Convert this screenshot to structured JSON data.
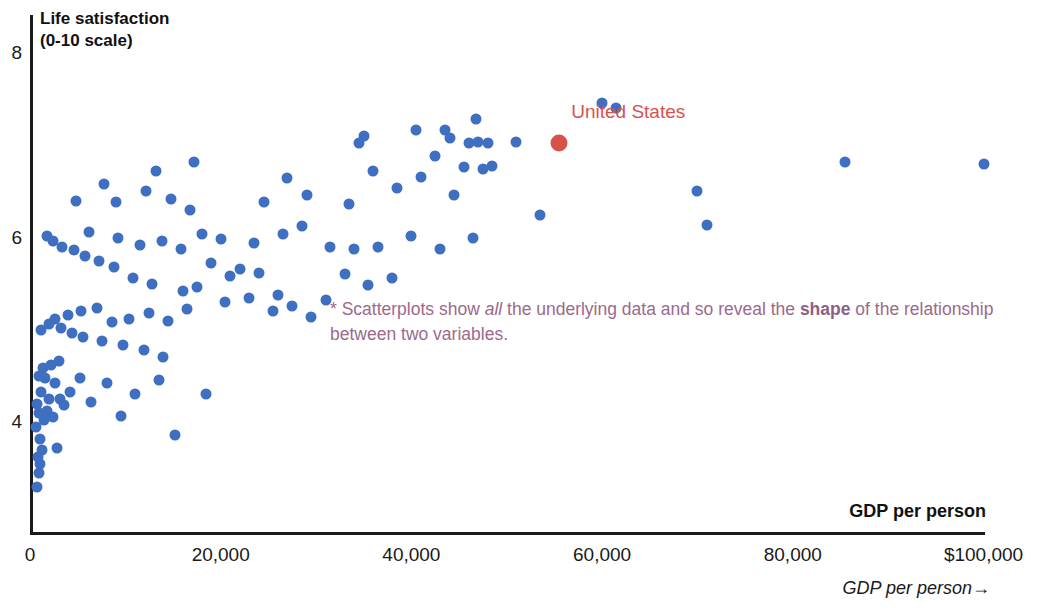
{
  "chart_data": {
    "type": "scatter",
    "title": "Life satisfaction\n(0-10 scale)",
    "xlabel": "GDP per person",
    "ylabel": "Life satisfaction (0-10 scale)",
    "xlim": [
      0,
      100000
    ],
    "ylim": [
      3.0,
      8.2
    ],
    "grid": false,
    "legend": "none",
    "xticks": [
      {
        "value": 0,
        "label": "0"
      },
      {
        "value": 20000,
        "label": "20,000"
      },
      {
        "value": 40000,
        "label": "40,000"
      },
      {
        "value": 60000,
        "label": "60,000"
      },
      {
        "value": 80000,
        "label": "80,000"
      },
      {
        "value": 100000,
        "label": "$100,000"
      }
    ],
    "yticks": [
      {
        "value": 8,
        "label": "8"
      },
      {
        "value": 6,
        "label": "6"
      },
      {
        "value": 4,
        "label": "4"
      }
    ],
    "series": [
      {
        "name": "Countries",
        "color": "#3f6fc0",
        "points": [
          [
            700,
            3.3
          ],
          [
            900,
            3.45
          ],
          [
            1100,
            3.55
          ],
          [
            800,
            3.62
          ],
          [
            1300,
            3.7
          ],
          [
            1000,
            3.82
          ],
          [
            600,
            3.95
          ],
          [
            1500,
            4.02
          ],
          [
            900,
            4.1
          ],
          [
            1800,
            4.12
          ],
          [
            700,
            4.2
          ],
          [
            2000,
            4.25
          ],
          [
            1200,
            4.32
          ],
          [
            2400,
            4.05
          ],
          [
            2800,
            3.72
          ],
          [
            3100,
            4.25
          ],
          [
            3600,
            4.18
          ],
          [
            4200,
            4.32
          ],
          [
            2600,
            4.42
          ],
          [
            1600,
            4.48
          ],
          [
            900,
            4.5
          ],
          [
            1400,
            4.58
          ],
          [
            2200,
            4.62
          ],
          [
            3000,
            4.66
          ],
          [
            5200,
            4.48
          ],
          [
            6400,
            4.22
          ],
          [
            8100,
            4.42
          ],
          [
            9500,
            4.06
          ],
          [
            11000,
            4.3
          ],
          [
            13500,
            4.46
          ],
          [
            15200,
            3.86
          ],
          [
            14000,
            4.7
          ],
          [
            12000,
            4.78
          ],
          [
            9800,
            4.84
          ],
          [
            7600,
            4.88
          ],
          [
            5600,
            4.92
          ],
          [
            4400,
            4.96
          ],
          [
            3200,
            5.02
          ],
          [
            2000,
            5.06
          ],
          [
            1200,
            5.0
          ],
          [
            2600,
            5.12
          ],
          [
            4000,
            5.16
          ],
          [
            5400,
            5.2
          ],
          [
            7000,
            5.24
          ],
          [
            8600,
            5.08
          ],
          [
            10400,
            5.12
          ],
          [
            12500,
            5.18
          ],
          [
            14500,
            5.1
          ],
          [
            16500,
            5.22
          ],
          [
            18500,
            4.3
          ],
          [
            20500,
            5.3
          ],
          [
            23000,
            5.34
          ],
          [
            25500,
            5.2
          ],
          [
            27500,
            5.26
          ],
          [
            29500,
            5.14
          ],
          [
            16000,
            5.42
          ],
          [
            17500,
            5.46
          ],
          [
            21000,
            5.58
          ],
          [
            26000,
            5.38
          ],
          [
            31000,
            5.32
          ],
          [
            35500,
            5.48
          ],
          [
            38000,
            5.56
          ],
          [
            33000,
            5.6
          ],
          [
            24000,
            5.62
          ],
          [
            22000,
            5.66
          ],
          [
            19000,
            5.72
          ],
          [
            12800,
            5.5
          ],
          [
            10800,
            5.56
          ],
          [
            8800,
            5.68
          ],
          [
            7200,
            5.74
          ],
          [
            5800,
            5.8
          ],
          [
            4600,
            5.86
          ],
          [
            3400,
            5.9
          ],
          [
            2400,
            5.96
          ],
          [
            1800,
            6.02
          ],
          [
            6200,
            6.06
          ],
          [
            9200,
            6.0
          ],
          [
            11500,
            5.92
          ],
          [
            13800,
            5.96
          ],
          [
            15800,
            5.88
          ],
          [
            18000,
            6.04
          ],
          [
            20000,
            5.98
          ],
          [
            23500,
            5.94
          ],
          [
            26500,
            6.04
          ],
          [
            28500,
            6.12
          ],
          [
            31500,
            5.9
          ],
          [
            34000,
            5.88
          ],
          [
            36500,
            5.9
          ],
          [
            40000,
            6.02
          ],
          [
            43000,
            5.88
          ],
          [
            46500,
            6.0
          ],
          [
            53500,
            6.24
          ],
          [
            4800,
            6.4
          ],
          [
            9000,
            6.38
          ],
          [
            14800,
            6.42
          ],
          [
            12200,
            6.5
          ],
          [
            16800,
            6.3
          ],
          [
            24500,
            6.38
          ],
          [
            29000,
            6.46
          ],
          [
            33500,
            6.36
          ],
          [
            38500,
            6.54
          ],
          [
            41000,
            6.66
          ],
          [
            44500,
            6.46
          ],
          [
            7800,
            6.58
          ],
          [
            17200,
            6.82
          ],
          [
            13200,
            6.72
          ],
          [
            27000,
            6.64
          ],
          [
            36000,
            6.72
          ],
          [
            45500,
            6.76
          ],
          [
            47500,
            6.74
          ],
          [
            48500,
            6.78
          ],
          [
            42500,
            6.88
          ],
          [
            46000,
            7.02
          ],
          [
            47000,
            7.04
          ],
          [
            48000,
            7.02
          ],
          [
            51000,
            7.04
          ],
          [
            35000,
            7.1
          ],
          [
            34500,
            7.02
          ],
          [
            40500,
            7.16
          ],
          [
            43500,
            7.16
          ],
          [
            44000,
            7.08
          ],
          [
            46800,
            7.28
          ],
          [
            60000,
            7.46
          ],
          [
            61500,
            7.4
          ],
          [
            70000,
            6.5
          ],
          [
            71000,
            6.14
          ],
          [
            85500,
            6.82
          ],
          [
            100000,
            6.8
          ]
        ]
      },
      {
        "name": "Highlighted country",
        "color": "#d9524a",
        "points": [
          [
            55500,
            7.02
          ]
        ],
        "labels": [
          "United States"
        ]
      }
    ],
    "annotations": [
      {
        "marker": "*",
        "text_plain": "* Scatterplots show all the underlying data and so reveal the shape of the relationship between two variables.",
        "segments": [
          {
            "text": "* Scatterplots show ",
            "style": "normal"
          },
          {
            "text": "all",
            "style": "italic"
          },
          {
            "text": " the underlying data and so reveal the ",
            "style": "normal"
          },
          {
            "text": "shape",
            "style": "bold"
          },
          {
            "text": " of the relationship between two variables.",
            "style": "normal"
          }
        ],
        "color": "#9b6a8c"
      }
    ],
    "footer_caption": "GDP per person→",
    "highlight_label": "United States",
    "highlight_color": "#d9524a",
    "point_color": "#3f6fc0",
    "axis_color": "#1a1a1a"
  }
}
